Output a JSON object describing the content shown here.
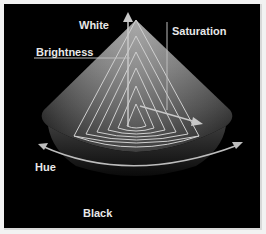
{
  "diagram": {
    "labels": {
      "white": "White",
      "brightness": "Brightness",
      "saturation": "Saturation",
      "hue": "Hue",
      "black": "Black"
    },
    "colors": {
      "background": "#000000",
      "page": "#f2f2f2",
      "cone_light": "#bdbdbd",
      "cone_dark": "#2a2a2a",
      "lines": "#d0d0d0",
      "text": "#e8e8e8"
    }
  }
}
